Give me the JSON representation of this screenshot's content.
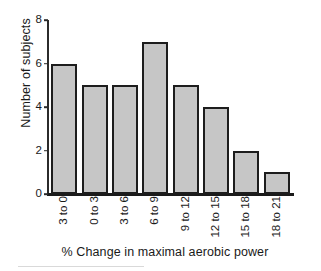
{
  "chart_data": {
    "type": "bar",
    "title": "",
    "xlabel": "% Change in maximal aerobic power",
    "ylabel": "Number of subjects",
    "categories": [
      "3 to 0",
      "0 to 3",
      "3 to 6",
      "6 to 9",
      "9 to 12",
      "12 to 15",
      "15 to 18",
      "18 to 21"
    ],
    "values": [
      6,
      5,
      5,
      7,
      5,
      4,
      2,
      1
    ],
    "ylim": [
      0,
      8
    ],
    "yticks": [
      0,
      2,
      4,
      6,
      8
    ],
    "ytick_labels": [
      "0",
      "2",
      "4",
      "6",
      "8"
    ],
    "grid": false,
    "legend": false,
    "bar_fill_color": "#c6c6c6",
    "bar_edge_color": "#1d1d1d",
    "axis_color": "#1a1a1a",
    "background_color": "#ffffff"
  }
}
